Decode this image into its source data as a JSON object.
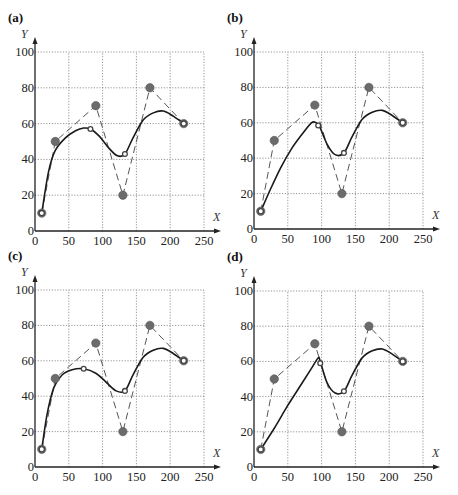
{
  "figure": {
    "panels": [
      {
        "id": "a",
        "label": "(a)",
        "origin_px": [
          35,
          231
        ],
        "x_end_px": 204,
        "y_top_px": 52
      },
      {
        "id": "b",
        "label": "(b)",
        "origin_px": [
          254,
          229
        ],
        "x_end_px": 423,
        "y_top_px": 52
      },
      {
        "id": "c",
        "label": "(c)",
        "origin_px": [
          35,
          467
        ],
        "x_end_px": 204,
        "y_top_px": 290
      },
      {
        "id": "d",
        "label": "(d)",
        "origin_px": [
          254,
          467
        ],
        "x_end_px": 423,
        "y_top_px": 291
      }
    ],
    "colors": {
      "curve": "#1a1a1a",
      "control_line": "#555555",
      "control_point": "#6b6b6b",
      "grid": "#7a7a7a"
    }
  },
  "chart_data": [
    {
      "panel": "(a)",
      "type": "line",
      "title": "(a)",
      "xlabel": "X",
      "ylabel": "Y",
      "xlim": [
        0,
        250
      ],
      "ylim": [
        0,
        100
      ],
      "x_ticks": [
        0,
        50,
        100,
        150,
        200,
        250
      ],
      "y_ticks": [
        0,
        20,
        40,
        60,
        80,
        100
      ],
      "grid": true,
      "series": [
        {
          "name": "control polygon",
          "style": "dashed",
          "marker": "filled-circle",
          "x": [
            10,
            30,
            90,
            130,
            170,
            220
          ],
          "y": [
            10,
            50,
            70,
            20,
            80,
            60
          ]
        },
        {
          "name": "fitted curve",
          "style": "solid",
          "x": [
            10,
            20,
            30,
            45,
            60,
            72,
            82,
            95,
            110,
            122,
            133,
            145,
            160,
            175,
            190,
            205,
            220
          ],
          "y": [
            10,
            33,
            45,
            52,
            56,
            57.5,
            57,
            53,
            46,
            42,
            43,
            52,
            62,
            66,
            67,
            64,
            60
          ]
        },
        {
          "name": "curve points",
          "marker": "open-circle",
          "x": [
            10,
            82,
            133,
            220
          ],
          "y": [
            10,
            57,
            43,
            60
          ]
        }
      ]
    },
    {
      "panel": "(b)",
      "type": "line",
      "title": "(b)",
      "xlabel": "X",
      "ylabel": "Y",
      "xlim": [
        0,
        250
      ],
      "ylim": [
        0,
        100
      ],
      "x_ticks": [
        0,
        50,
        100,
        150,
        200,
        250
      ],
      "y_ticks": [
        0,
        20,
        40,
        60,
        80,
        100
      ],
      "grid": true,
      "series": [
        {
          "name": "control polygon",
          "style": "dashed",
          "marker": "filled-circle",
          "x": [
            10,
            30,
            90,
            130,
            170,
            220
          ],
          "y": [
            10,
            50,
            70,
            20,
            80,
            60
          ]
        },
        {
          "name": "fitted curve",
          "style": "solid",
          "x": [
            10,
            25,
            40,
            55,
            70,
            85,
            92,
            97,
            108,
            120,
            133,
            145,
            160,
            175,
            190,
            205,
            220
          ],
          "y": [
            10,
            23,
            35,
            45,
            53,
            60,
            60,
            58,
            48,
            42,
            43,
            52,
            62,
            66,
            67,
            64,
            60
          ]
        },
        {
          "name": "curve points",
          "marker": "open-circle",
          "x": [
            10,
            95,
            133,
            220
          ],
          "y": [
            10,
            58.5,
            43,
            60
          ]
        }
      ]
    },
    {
      "panel": "(c)",
      "type": "line",
      "title": "(c)",
      "xlabel": "X",
      "ylabel": "Y",
      "xlim": [
        0,
        250
      ],
      "ylim": [
        0,
        100
      ],
      "x_ticks": [
        0,
        50,
        100,
        150,
        200,
        250
      ],
      "y_ticks": [
        0,
        20,
        40,
        60,
        80,
        100
      ],
      "grid": true,
      "series": [
        {
          "name": "control polygon",
          "style": "dashed",
          "marker": "filled-circle",
          "x": [
            10,
            30,
            90,
            130,
            170,
            220
          ],
          "y": [
            10,
            50,
            70,
            20,
            80,
            60
          ]
        },
        {
          "name": "fitted curve",
          "style": "solid",
          "x": [
            10,
            18,
            28,
            40,
            55,
            72,
            90,
            105,
            120,
            133,
            145,
            160,
            175,
            190,
            205,
            220
          ],
          "y": [
            10,
            30,
            45,
            52,
            55,
            55.5,
            53,
            48,
            43,
            43,
            52,
            62,
            66,
            67,
            64,
            60
          ]
        },
        {
          "name": "curve points",
          "marker": "open-circle",
          "x": [
            10,
            72,
            133,
            220
          ],
          "y": [
            10,
            55.5,
            43,
            60
          ]
        }
      ]
    },
    {
      "panel": "(d)",
      "type": "line",
      "title": "(d)",
      "xlabel": "X",
      "ylabel": "Y",
      "xlim": [
        0,
        250
      ],
      "ylim": [
        0,
        100
      ],
      "x_ticks": [
        0,
        50,
        100,
        150,
        200,
        250
      ],
      "y_ticks": [
        0,
        20,
        40,
        60,
        80,
        100
      ],
      "grid": true,
      "series": [
        {
          "name": "control polygon",
          "style": "dashed",
          "marker": "filled-circle",
          "x": [
            10,
            30,
            90,
            130,
            170,
            220
          ],
          "y": [
            10,
            50,
            70,
            20,
            80,
            60
          ]
        },
        {
          "name": "fitted curve",
          "style": "solid",
          "x": [
            10,
            30,
            50,
            70,
            85,
            95,
            98,
            108,
            120,
            133,
            145,
            160,
            175,
            190,
            205,
            220
          ],
          "y": [
            10,
            22,
            35,
            47,
            56,
            62,
            60,
            48,
            42,
            43,
            52,
            62,
            66,
            67,
            64,
            60
          ]
        },
        {
          "name": "curve points",
          "marker": "open-circle",
          "x": [
            10,
            98,
            133,
            220
          ],
          "y": [
            10,
            59,
            43,
            60
          ]
        }
      ]
    }
  ]
}
